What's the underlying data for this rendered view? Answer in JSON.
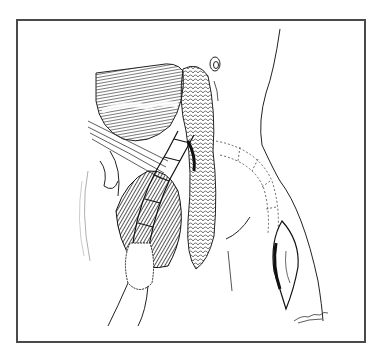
{
  "figure": {
    "type": "medical-illustration",
    "style": "pen-and-ink line drawing",
    "border_color": "#4a4a4a",
    "ink_color": "#1a1a1a",
    "background": "#ffffff",
    "elements": [
      "retracted-muscle-flap",
      "tracheal-rings-tube",
      "vessel-loops",
      "neck-contour",
      "ear",
      "tunneled-graft-dotted",
      "chest-incision",
      "artist-signature"
    ]
  }
}
